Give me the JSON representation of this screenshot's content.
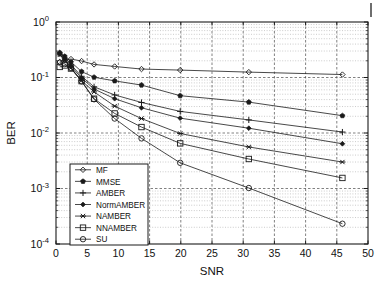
{
  "figure": {
    "kind": "semilog-y line plot",
    "background": "#ffffff",
    "line_color": "#1a1a1a",
    "grid_color": "#9a9a9a",
    "axis_color": "#1a1a1a",
    "artifact_note": "small dark vertical tick mark near top-right edge"
  },
  "chart_data": {
    "type": "line",
    "title": "",
    "subtitle": "",
    "xlabel": "SNR",
    "ylabel": "BER",
    "xlim": [
      0,
      50
    ],
    "ylim": [
      0.0001,
      1
    ],
    "yscale": "log",
    "xscale": "linear",
    "grid": true,
    "grid_minor": true,
    "xticks": [
      0,
      5,
      10,
      15,
      20,
      25,
      30,
      35,
      40,
      45,
      50
    ],
    "xticklabels": [
      "0",
      "5",
      "10",
      "15",
      "20",
      "25",
      "30",
      "35",
      "40",
      "45",
      "50"
    ],
    "yticks": [
      1,
      0.1,
      0.01,
      0.001,
      0.0001
    ],
    "yticklabels": [
      "10^0",
      "10^-1",
      "10^-2",
      "10^-3",
      "10^-4"
    ],
    "ytickmantissas": [
      "10",
      "10",
      "10",
      "10",
      "10"
    ],
    "ytickexponents": [
      "0",
      "-1",
      "-2",
      "-3",
      "-4"
    ],
    "legend_position": "lower left",
    "legend_entries": [
      "MF",
      "MMSE",
      "AMBER",
      "NormAMBER",
      "NAMBER",
      "NNAMBER",
      "SU"
    ],
    "series": [
      {
        "name": "MF",
        "marker": "diamond-open",
        "x": [
          0.6,
          1.4,
          2.4,
          4.1,
          6.1,
          9.4,
          13.7,
          19.9,
          30.9,
          45.9
        ],
        "values": [
          0.19,
          0.205,
          0.215,
          0.198,
          0.172,
          0.158,
          0.142,
          0.136,
          0.125,
          0.113
        ]
      },
      {
        "name": "MMSE",
        "marker": "pentagon-filled",
        "x": [
          0.6,
          1.4,
          2.4,
          4.1,
          6.1,
          9.4,
          13.7,
          19.9,
          30.9,
          45.9
        ],
        "values": [
          0.28,
          0.24,
          0.19,
          0.128,
          0.101,
          0.087,
          0.073,
          0.047,
          0.036,
          0.0205
        ]
      },
      {
        "name": "AMBER",
        "marker": "plus",
        "x": [
          0.6,
          1.4,
          2.4,
          4.1,
          6.1,
          9.4,
          13.7,
          19.9,
          30.9,
          45.9
        ],
        "values": [
          0.275,
          0.225,
          0.17,
          0.105,
          0.068,
          0.0485,
          0.0355,
          0.0245,
          0.0172,
          0.0104
        ]
      },
      {
        "name": "NormAMBER",
        "marker": "diamond-filled",
        "x": [
          0.6,
          1.4,
          2.4,
          4.1,
          6.1,
          9.4,
          13.7,
          19.9,
          30.9,
          45.9
        ],
        "values": [
          0.265,
          0.215,
          0.16,
          0.098,
          0.062,
          0.0415,
          0.0285,
          0.0185,
          0.0122,
          0.0064
        ]
      },
      {
        "name": "NAMBER",
        "marker": "asterisk",
        "x": [
          0.6,
          1.4,
          2.4,
          4.1,
          6.1,
          9.4,
          13.7,
          19.9,
          30.9,
          45.9
        ],
        "values": [
          0.255,
          0.205,
          0.15,
          0.088,
          0.055,
          0.0305,
          0.0182,
          0.0098,
          0.0056,
          0.003
        ]
      },
      {
        "name": "NNAMBER",
        "marker": "square-open",
        "x": [
          0.6,
          1.4,
          2.4,
          4.1,
          6.1,
          9.4,
          13.7,
          19.9,
          30.9,
          45.9
        ],
        "values": [
          0.155,
          0.165,
          0.145,
          0.086,
          0.0415,
          0.0225,
          0.0128,
          0.0065,
          0.0034,
          0.00155
        ]
      },
      {
        "name": "SU",
        "marker": "circle-open",
        "x": [
          0.6,
          1.4,
          2.4,
          4.1,
          6.1,
          9.4,
          13.7,
          19.9,
          30.9,
          45.9
        ],
        "values": [
          0.185,
          0.175,
          0.148,
          0.085,
          0.0405,
          0.0182,
          0.008,
          0.0029,
          0.00102,
          0.000232
        ]
      }
    ]
  }
}
